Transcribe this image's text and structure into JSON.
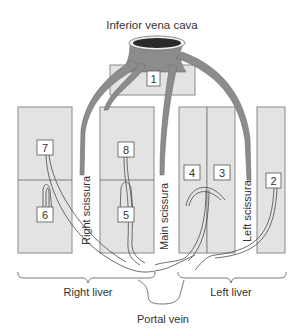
{
  "title": "Inferior vena cava",
  "segments": {
    "s1": "1",
    "s2": "2",
    "s3": "3",
    "s4": "4",
    "s5": "5",
    "s6": "6",
    "s7": "7",
    "s8": "8"
  },
  "scissurae": {
    "right": "Right scissura",
    "main": "Main scissura",
    "left": "Left scissura"
  },
  "regions": {
    "right_liver": "Right liver",
    "left_liver": "Left liver"
  },
  "portal_vein": "Portal vein",
  "colors": {
    "segment_fill": "#e3e3e3",
    "segment_stroke": "#888888",
    "vein_fill": "#8c8c8c",
    "ivc_lumen": "#2a2a2a",
    "line": "#444444"
  }
}
